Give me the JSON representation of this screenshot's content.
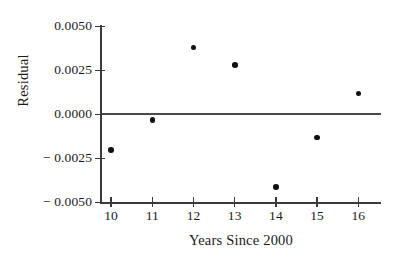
{
  "chart_data": {
    "type": "scatter",
    "title": "",
    "xlabel": "Years Since 2000",
    "ylabel": "Residual",
    "x": [
      10,
      11,
      12,
      13,
      14,
      15,
      16
    ],
    "values": [
      -0.002,
      -0.0003,
      0.0038,
      0.0028,
      -0.0041,
      -0.0013,
      0.0012
    ],
    "points": [
      {
        "x": 10,
        "y": -0.002
      },
      {
        "x": 11,
        "y": -0.0003
      },
      {
        "x": 12,
        "y": 0.0038
      },
      {
        "x": 13,
        "y": 0.0028
      },
      {
        "x": 14,
        "y": -0.0041
      },
      {
        "x": 15,
        "y": -0.0013
      },
      {
        "x": 16,
        "y": 0.0012
      }
    ],
    "xlim": [
      9.75,
      16.55
    ],
    "ylim": [
      -0.005,
      0.005
    ],
    "xticks": [
      10,
      11,
      12,
      13,
      14,
      15,
      16
    ],
    "xtick_labels": [
      "10",
      "11",
      "12",
      "13",
      "14",
      "15",
      "16"
    ],
    "yticks": [
      0.005,
      0.0025,
      0.0,
      -0.0025,
      -0.005
    ],
    "ytick_labels": [
      "0.0050",
      "0.0025",
      "0.0000",
      "− 0.0025",
      "− 0.0050"
    ],
    "grid": false,
    "legend": false,
    "reference_line": {
      "y": 0.0,
      "color": "#4a4a4a"
    },
    "marker_color": "#111111",
    "axis_color": "#3a3a3a",
    "background": "#ffffff"
  }
}
